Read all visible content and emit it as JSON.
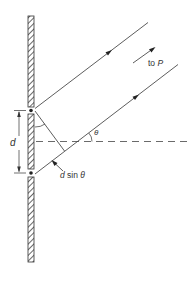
{
  "diagram": {
    "labels": {
      "slit_separation": "d",
      "path_difference_d": "d",
      "path_difference_sin": " sin ",
      "path_difference_theta": "θ",
      "angle": "θ",
      "direction_to": "to ",
      "direction_point": "P"
    },
    "colors": {
      "line": "#333333",
      "hatch": "#444444",
      "background": "#ffffff"
    }
  }
}
